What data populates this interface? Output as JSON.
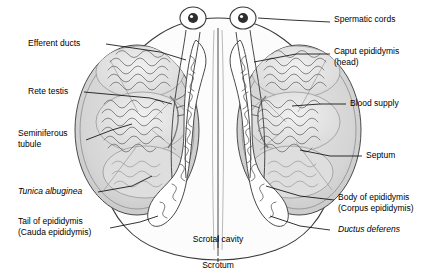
{
  "diagram": {
    "colors": {
      "background": "#ffffff",
      "outline": "#3a3a3a",
      "testis_fill": "#d8d8d8",
      "testis_inner": "#c9c9c9",
      "lobule_fill": "#e8e8e8",
      "duct_fill": "#ffffff",
      "cord_fill": "#ffffff",
      "leader_line": "#000000",
      "scrotum_fill": "#ffffff"
    },
    "labels": [
      {
        "id": "efferent-ducts",
        "lines": [
          "Efferent ducts"
        ],
        "align": "left",
        "italic": [
          false
        ]
      },
      {
        "id": "rete-testis",
        "lines": [
          "Rete testis"
        ],
        "align": "left",
        "italic": [
          false
        ]
      },
      {
        "id": "seminiferous-tubule",
        "lines": [
          "Seminiferous",
          "tubule"
        ],
        "align": "left",
        "italic": [
          false,
          false
        ]
      },
      {
        "id": "tunica-albuginea",
        "lines": [
          "Tunica albuginea"
        ],
        "align": "left",
        "italic": [
          true
        ]
      },
      {
        "id": "tail-of-epididymis",
        "lines": [
          "Tail of epididymis",
          "(Cauda epididymis)"
        ],
        "align": "left",
        "italic": [
          false,
          true
        ]
      },
      {
        "id": "spermatic-cords",
        "lines": [
          "Spermatic cords"
        ],
        "align": "left",
        "italic": [
          false
        ]
      },
      {
        "id": "caput-epididymis",
        "lines": [
          "Caput epididymis",
          "(head)"
        ],
        "align": "left",
        "italic": [
          true,
          false
        ]
      },
      {
        "id": "blood-supply",
        "lines": [
          "Blood supply"
        ],
        "align": "left",
        "italic": [
          false
        ]
      },
      {
        "id": "septum",
        "lines": [
          "Septum"
        ],
        "align": "left",
        "italic": [
          false
        ]
      },
      {
        "id": "body-of-epididymis",
        "lines": [
          "Body of epididymis",
          "(Corpus epididymis)"
        ],
        "align": "left",
        "italic": [
          false,
          true
        ]
      },
      {
        "id": "ductus-deferens",
        "lines": [
          "Ductus deferens"
        ],
        "align": "left",
        "italic": [
          true
        ]
      },
      {
        "id": "scrotal-cavity",
        "lines": [
          "Scrotal cavity"
        ],
        "align": "center",
        "italic": [
          false
        ]
      },
      {
        "id": "scrotum",
        "lines": [
          "Scrotum"
        ],
        "align": "center",
        "italic": [
          false
        ]
      }
    ]
  }
}
